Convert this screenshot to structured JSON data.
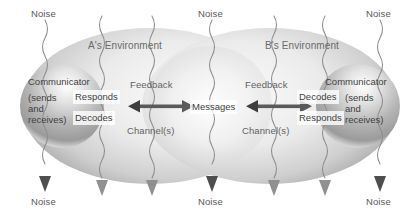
{
  "diagram": {
    "colors": {
      "ellipse_dark": "#b9b9b9",
      "ellipse_light": "#f2f2f2",
      "sphere_dark": "#9a9a9a",
      "sphere_light": "#fdfdfd",
      "arrow": "#555555",
      "noise_line": "#8f8f8f",
      "text": "#4a4a4a",
      "background": "#ffffff"
    },
    "environments": [
      {
        "id": "a",
        "label": "A's Environment"
      },
      {
        "id": "b",
        "label": "B's Environment"
      }
    ],
    "communicators": [
      {
        "id": "a",
        "title": "Communicator",
        "detail_lines": [
          "(sends",
          "and",
          "receives)"
        ],
        "process_lines": [
          "Responds",
          "Decodes"
        ]
      },
      {
        "id": "b",
        "title": "Communicator",
        "detail_lines": [
          "(sends",
          "and",
          "receives)"
        ],
        "process_lines": [
          "Decodes",
          "Responds"
        ]
      }
    ],
    "center_label": "Messages",
    "channels": [
      {
        "id": "left",
        "feedback": "Feedback",
        "channel": "Channel(s)"
      },
      {
        "id": "right",
        "feedback": "Feedback",
        "channel": "Channel(s)"
      }
    ],
    "noise_labels_top": [
      "Noise",
      "Noise",
      "Noise"
    ],
    "noise_labels_bottom": [
      "Noise",
      "Noise",
      "Noise"
    ],
    "noise_line_count": 7
  }
}
